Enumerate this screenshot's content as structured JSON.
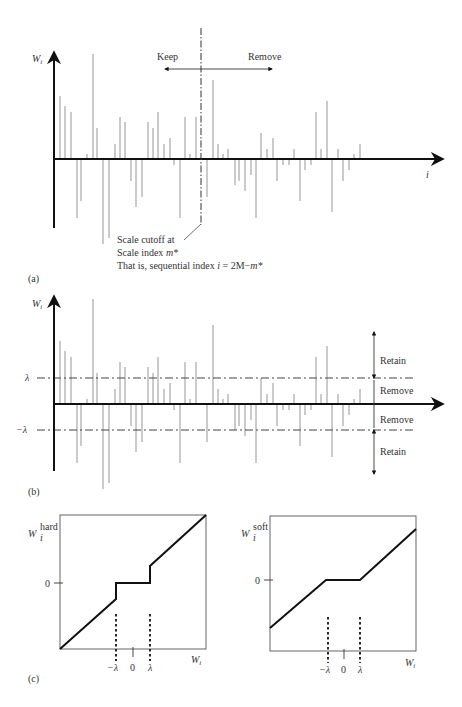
{
  "panel_a": {
    "label": "(a)",
    "y_axis_label": "W",
    "y_axis_sub": "i",
    "x_axis_label": "i",
    "keep_label": "Keep",
    "remove_label": "Remove",
    "cutoff_line1": "Scale cutoff at",
    "cutoff_line2_pre": "Scale index ",
    "cutoff_line2_var": "m*",
    "cutoff_line3_pre": "That is, sequential index ",
    "cutoff_line3_var": "i",
    "cutoff_line3_eq": " = 2M−",
    "cutoff_line3_var2": "m*"
  },
  "panel_b": {
    "label": "(b)",
    "y_axis_label": "W",
    "y_axis_sub": "i",
    "lambda_label": "λ",
    "neg_lambda_label": "−λ",
    "retain_top": "Retain",
    "remove_top": "Remove",
    "remove_bottom": "Remove",
    "retain_bottom": "Retain"
  },
  "panel_c": {
    "label": "(c)",
    "hard": {
      "y_label": "W",
      "y_sub": "i",
      "y_sup": "hard",
      "zero_label": "0",
      "x_label": "W",
      "x_sub": "i",
      "neg_lambda": "−λ",
      "zero_x": "0",
      "lambda": "λ"
    },
    "soft": {
      "y_label": "W",
      "y_sub": "i",
      "y_sup": "soft",
      "zero_label": "0",
      "x_label": "W",
      "x_sub": "i",
      "neg_lambda": "−λ",
      "zero_x": "0",
      "lambda": "λ"
    }
  },
  "colors": {
    "axis": "#111111",
    "bar": "#8a8a8a",
    "threshold_line": "#444444"
  },
  "chart_data": {
    "type": "bar",
    "xlabel": "i",
    "ylabel": "W_i",
    "bars_px_relative_axis": [
      [
        60,
        63
      ],
      [
        65,
        53
      ],
      [
        71,
        47
      ],
      [
        77,
        -59
      ],
      [
        81,
        -42
      ],
      [
        87,
        5
      ],
      [
        93,
        105
      ],
      [
        97,
        31
      ],
      [
        103,
        -85
      ],
      [
        109,
        -79
      ],
      [
        115,
        15
      ],
      [
        120,
        42
      ],
      [
        125,
        37
      ],
      [
        131,
        -22
      ],
      [
        136,
        -48
      ],
      [
        142,
        -38
      ],
      [
        148,
        37
      ],
      [
        153,
        31
      ],
      [
        158,
        47
      ],
      [
        164,
        15
      ],
      [
        170,
        21
      ],
      [
        174,
        -6
      ],
      [
        180,
        -59
      ],
      [
        185,
        42
      ],
      [
        190,
        5
      ],
      [
        196,
        42
      ],
      [
        207,
        -38
      ],
      [
        213,
        79
      ],
      [
        218,
        15
      ],
      [
        223,
        5
      ],
      [
        228,
        10
      ],
      [
        235,
        -26
      ],
      [
        239,
        -22
      ],
      [
        245,
        -32
      ],
      [
        251,
        -16
      ],
      [
        256,
        -59
      ],
      [
        261,
        26
      ],
      [
        267,
        10
      ],
      [
        273,
        21
      ],
      [
        277,
        -22
      ],
      [
        283,
        -6
      ],
      [
        289,
        -6
      ],
      [
        294,
        10
      ],
      [
        300,
        -42
      ],
      [
        305,
        -11
      ],
      [
        311,
        -6
      ],
      [
        316,
        47
      ],
      [
        321,
        10
      ],
      [
        327,
        58
      ],
      [
        332,
        -53
      ],
      [
        338,
        10
      ],
      [
        343,
        -22
      ],
      [
        349,
        -11
      ],
      [
        354,
        5
      ],
      [
        360,
        15
      ]
    ],
    "cutoff_index_x_px": 201,
    "threshold_lambda_px": 26,
    "hard_threshold": "W_hard = W if |W| > lambda else 0",
    "soft_threshold": "W_soft = sign(W)(|W| - lambda) if |W| > lambda else 0"
  }
}
